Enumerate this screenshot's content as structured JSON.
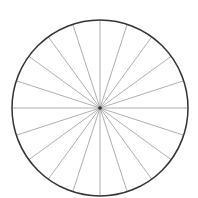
{
  "diagram": {
    "type": "spoked-circle",
    "center": [
      100,
      108
    ],
    "radius": 88,
    "spoke_count": 20,
    "angle_step_deg": 18,
    "colors": {
      "rim": "#333333",
      "spokes": "#9a9a9a",
      "hub": "#333333",
      "background": "#ffffff"
    }
  }
}
